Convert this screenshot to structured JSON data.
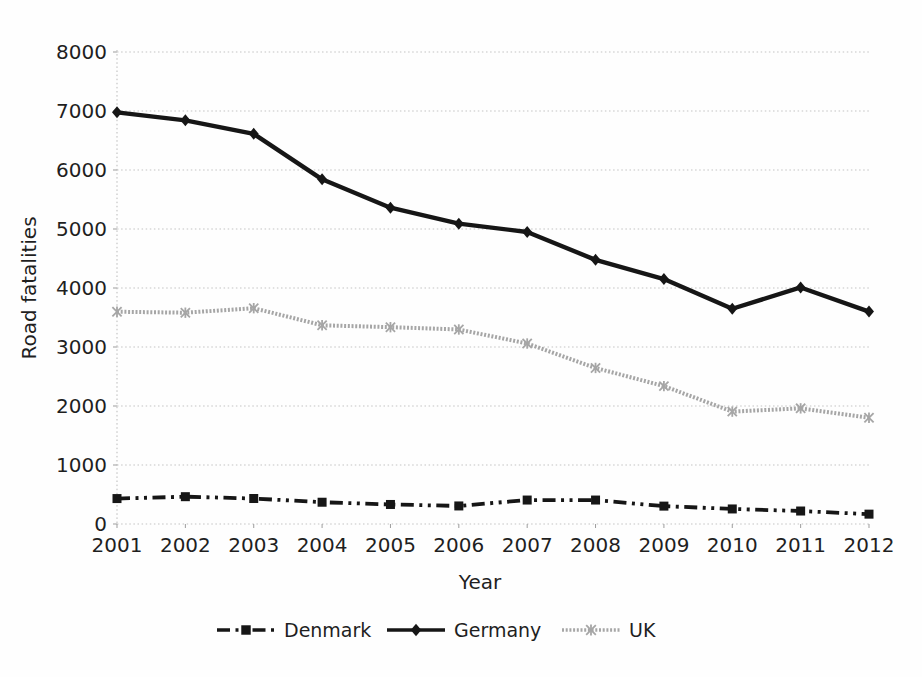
{
  "chart_data": {
    "type": "line",
    "title": "",
    "xlabel": "Year",
    "ylabel": "Road fatalities",
    "x": [
      "2001",
      "2002",
      "2003",
      "2004",
      "2005",
      "2006",
      "2007",
      "2008",
      "2009",
      "2010",
      "2011",
      "2012"
    ],
    "y_ticks": [
      0,
      1000,
      2000,
      3000,
      4000,
      5000,
      6000,
      7000,
      8000
    ],
    "ylim": [
      0,
      8000
    ],
    "grid": "horizontal-dotted",
    "legend_position": "bottom",
    "colors": {
      "black_series": "#161616",
      "gray_series": "#a6a6a6",
      "gridline": "#c3c3c3",
      "text": "#1f1f1f"
    },
    "series": [
      {
        "name": "Denmark",
        "color": "#161616",
        "line_style": "dash-dot-dot",
        "marker": "square",
        "values": [
          431,
          463,
          432,
          369,
          331,
          306,
          406,
          406,
          303,
          255,
          220,
          167
        ]
      },
      {
        "name": "Germany",
        "color": "#161616",
        "line_style": "solid",
        "marker": "diamond",
        "values": [
          6977,
          6842,
          6613,
          5842,
          5361,
          5091,
          4949,
          4477,
          4152,
          3648,
          4009,
          3600
        ]
      },
      {
        "name": "UK",
        "color": "#a6a6a6",
        "line_style": "textured",
        "marker": "x-star",
        "values": [
          3598,
          3581,
          3658,
          3368,
          3336,
          3297,
          3059,
          2645,
          2337,
          1905,
          1960,
          1802
        ]
      }
    ]
  }
}
